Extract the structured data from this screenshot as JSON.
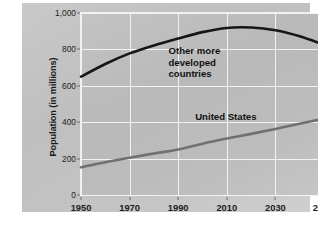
{
  "chart_data": {
    "type": "line",
    "title": "",
    "xlabel": "",
    "ylabel": "Population (in millions)",
    "xlim": [
      1950,
      2050
    ],
    "ylim": [
      0,
      1000
    ],
    "grid": true,
    "legend_position": "inline-annotations",
    "xticks": [
      "1950",
      "1970",
      "1990",
      "2010",
      "2030",
      "2050"
    ],
    "xtick_values": [
      1950,
      1970,
      1990,
      2010,
      2030,
      2050
    ],
    "yticks": [
      "0",
      "200",
      "400",
      "600",
      "800",
      "1,000"
    ],
    "ytick_values": [
      0,
      200,
      400,
      600,
      800,
      1000
    ],
    "x": [
      1950,
      1960,
      1970,
      1980,
      1990,
      2000,
      2010,
      2020,
      2030,
      2040,
      2050
    ],
    "series": [
      {
        "name": "Other more developed countries",
        "color": "#161616",
        "values": [
          650,
          720,
          778,
          822,
          860,
          895,
          918,
          920,
          905,
          872,
          825
        ]
      },
      {
        "name": "United States",
        "color": "#707070",
        "values": [
          152,
          180,
          205,
          228,
          250,
          282,
          310,
          336,
          363,
          392,
          420
        ]
      }
    ],
    "annotations": [
      {
        "id": "other-more-developed-countries",
        "text": "Other more\ndeveloped\ncountries",
        "x": 1986,
        "y": 790
      },
      {
        "id": "united-states",
        "text": "United States",
        "x": 1997,
        "y": 430
      }
    ]
  },
  "colors": {
    "panel_background": "#c6c6c6",
    "plot_background": "#bdbdbd",
    "gridline": "#f2f2f2",
    "axis_text": "#1d1d1d",
    "other_developed_line": "#161616",
    "united_states_line": "#707070"
  }
}
